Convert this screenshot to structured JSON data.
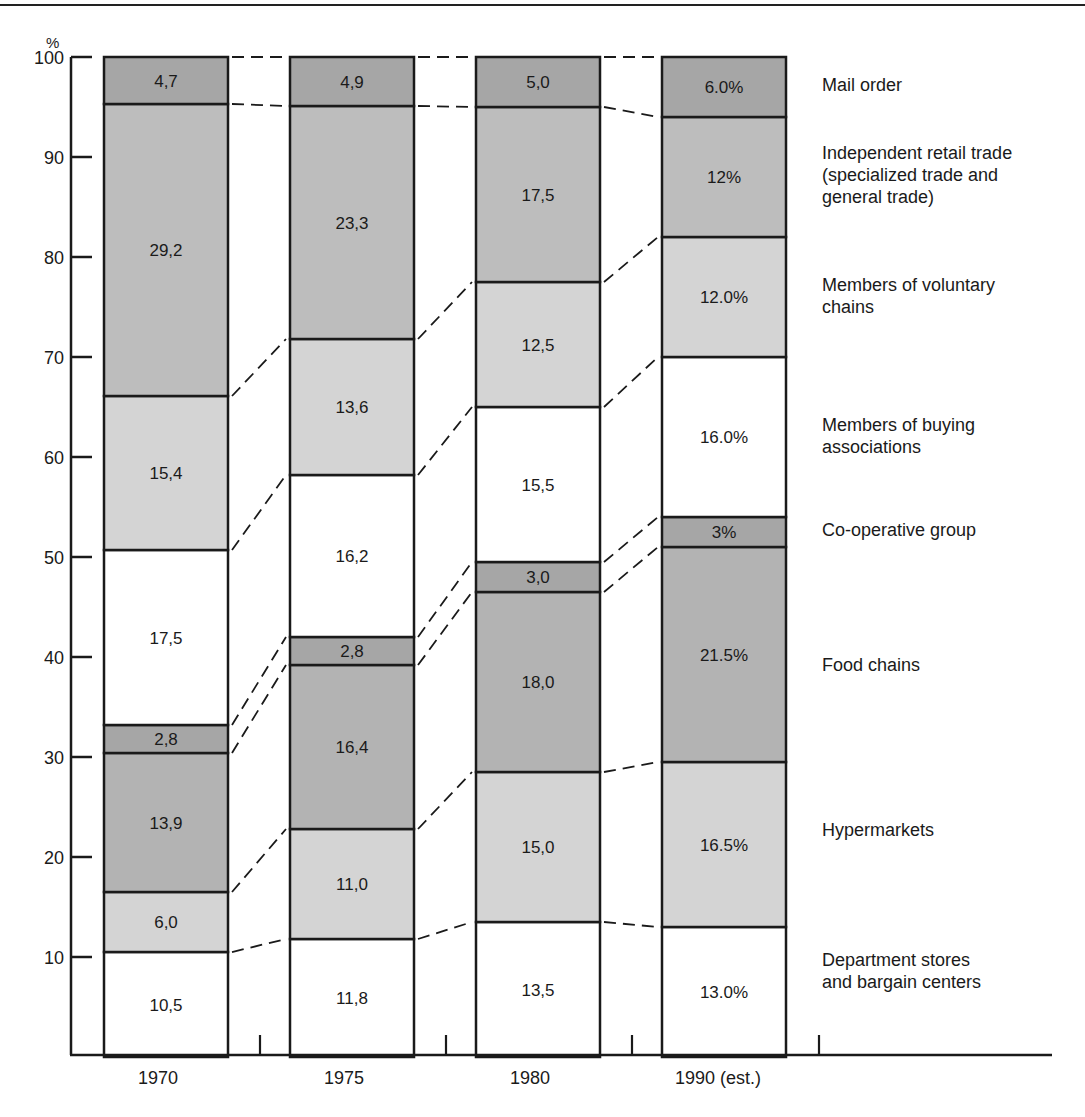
{
  "chart_data": {
    "type": "bar",
    "stacked": true,
    "title": "",
    "xlabel": "",
    "ylabel": "%",
    "ylim": [
      0,
      100
    ],
    "yticks": [
      10,
      20,
      30,
      40,
      50,
      60,
      70,
      80,
      90,
      100
    ],
    "categories": [
      "1970",
      "1975",
      "1980",
      "1990 (est.)"
    ],
    "series": [
      {
        "name": "Department stores and bargain centers",
        "values": [
          10.5,
          11.8,
          13.5,
          13.0
        ],
        "labels": [
          "10,5",
          "11,8",
          "13,5",
          "13.0%"
        ],
        "fill": "#ffffff"
      },
      {
        "name": "Hypermarkets",
        "values": [
          6.0,
          11.0,
          15.0,
          16.5
        ],
        "labels": [
          "6,0",
          "11,0",
          "15,0",
          "16.5%"
        ],
        "fill": "#d4d4d4"
      },
      {
        "name": "Food chains",
        "values": [
          13.9,
          16.4,
          18.0,
          21.5
        ],
        "labels": [
          "13,9",
          "16,4",
          "18,0",
          "21.5%"
        ],
        "fill": "#b3b3b3"
      },
      {
        "name": "Co-operative group",
        "values": [
          2.8,
          2.8,
          3.0,
          3.0
        ],
        "labels": [
          "2,8",
          "2,8",
          "3,0",
          "3%"
        ],
        "fill": "#a6a6a6"
      },
      {
        "name": "Members of buying associations",
        "values": [
          17.5,
          16.2,
          15.5,
          16.0
        ],
        "labels": [
          "17,5",
          "16,2",
          "15,5",
          "16.0%"
        ],
        "fill": "#ffffff"
      },
      {
        "name": "Members of voluntary chains",
        "values": [
          15.4,
          13.6,
          12.5,
          12.0
        ],
        "labels": [
          "15,4",
          "13,6",
          "12,5",
          "12.0%"
        ],
        "fill": "#d4d4d4"
      },
      {
        "name": "Independent retail trade (specialized trade and general trade)",
        "values": [
          29.2,
          23.3,
          17.5,
          12.0
        ],
        "labels": [
          "29,2",
          "23,3",
          "17,5",
          "12%"
        ],
        "fill": "#bdbdbd"
      },
      {
        "name": "Mail order",
        "values": [
          4.7,
          4.9,
          5.0,
          6.0
        ],
        "labels": [
          "4,7",
          "4,9",
          "5,0",
          "6.0%"
        ],
        "fill": "#a6a6a6"
      }
    ],
    "legend_position": "right",
    "grid": false
  },
  "axis": {
    "unit_label": "%",
    "ticks": [
      "10",
      "20",
      "30",
      "40",
      "50",
      "60",
      "70",
      "80",
      "90",
      "100"
    ]
  },
  "legend": [
    {
      "key": "mail",
      "lines": [
        "Mail order"
      ]
    },
    {
      "key": "independent",
      "lines": [
        "Independent retail trade",
        "(specialized trade and",
        "general trade)"
      ]
    },
    {
      "key": "voluntary",
      "lines": [
        "Members of voluntary",
        "chains"
      ]
    },
    {
      "key": "buying",
      "lines": [
        "Members of buying",
        "associations"
      ]
    },
    {
      "key": "coop",
      "lines": [
        "Co-operative group"
      ]
    },
    {
      "key": "food",
      "lines": [
        "Food chains"
      ]
    },
    {
      "key": "hyper",
      "lines": [
        "Hypermarkets"
      ]
    },
    {
      "key": "dept",
      "lines": [
        "Department stores",
        "and bargain centers"
      ]
    }
  ],
  "x_labels": [
    "1970",
    "1975",
    "1980",
    "1990 (est.)"
  ],
  "colors": {
    "ink": "#1a1a1a",
    "light_fill": "#d4d4d4",
    "mid_fill": "#bdbdbd",
    "dark_fill": "#a6a6a6",
    "white_fill": "#ffffff"
  }
}
